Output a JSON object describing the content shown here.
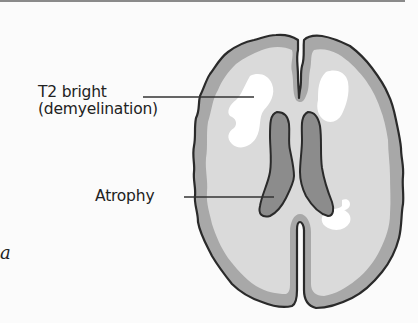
{
  "figure": {
    "panel_label": "a",
    "labels": [
      {
        "line1": "T2 bright",
        "line2": "(demyelination)"
      },
      {
        "line1": "Atrophy"
      }
    ]
  },
  "colors": {
    "background": "#fbfbfb",
    "outline": "#2a2a2a",
    "cortex_gray": "#a8a8a8",
    "white_matter": "#dadada",
    "lesion_white": "#ffffff",
    "ventricle": "#8c8c8c",
    "leader_line": "#333333"
  }
}
